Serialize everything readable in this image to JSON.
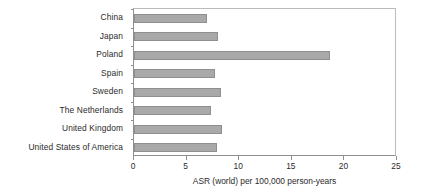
{
  "chart_data": {
    "type": "bar",
    "orientation": "horizontal",
    "title": "",
    "xlabel": "ASR (world) per 100,000 person-years",
    "ylabel": "",
    "xlim": [
      0,
      25
    ],
    "xticks": [
      0,
      5,
      10,
      15,
      20,
      25
    ],
    "xtick_labels": [
      "0",
      "5",
      "10",
      "15",
      "20",
      "25"
    ],
    "grid": false,
    "legend": false,
    "bar_color": "#a9a9a9",
    "bar_edge_color": "#8f8f8f",
    "axis_color": "#8d9092",
    "categories": [
      "China",
      "Japan",
      "Poland",
      "Spain",
      "Sweden",
      "The Netherlands",
      "United Kingdom",
      "United States of America"
    ],
    "values": [
      6.9,
      8.0,
      18.6,
      7.7,
      8.3,
      7.3,
      8.4,
      7.9
    ]
  }
}
